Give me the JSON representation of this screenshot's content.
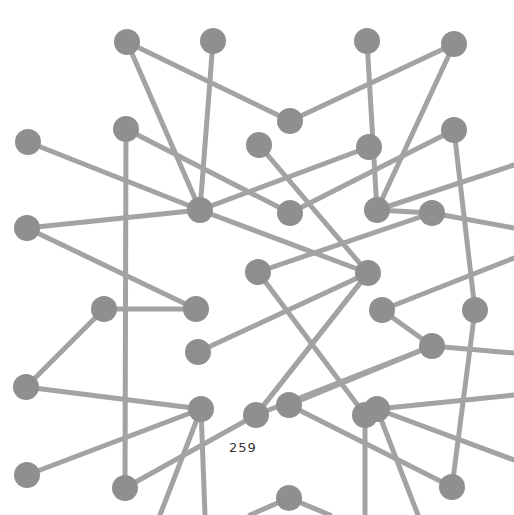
{
  "page": {
    "page_number": "259",
    "background": "#ffffff"
  },
  "diagram": {
    "type": "network-graph",
    "node_color": "#8f8f8f",
    "edge_color": "#a3a3a3",
    "node_radius": 13,
    "nodes": [
      {
        "id": "A",
        "x": 127,
        "y": 42
      },
      {
        "id": "B",
        "x": 213,
        "y": 41
      },
      {
        "id": "C",
        "x": 367,
        "y": 41
      },
      {
        "id": "D",
        "x": 454,
        "y": 44
      },
      {
        "id": "E",
        "x": 290,
        "y": 121
      },
      {
        "id": "F",
        "x": 28,
        "y": 142
      },
      {
        "id": "G",
        "x": 126,
        "y": 129
      },
      {
        "id": "H",
        "x": 259,
        "y": 145
      },
      {
        "id": "I",
        "x": 369,
        "y": 147
      },
      {
        "id": "J",
        "x": 454,
        "y": 130
      },
      {
        "id": "K",
        "x": 200,
        "y": 210
      },
      {
        "id": "L",
        "x": 290,
        "y": 213
      },
      {
        "id": "M",
        "x": 377,
        "y": 210
      },
      {
        "id": "N",
        "x": 432,
        "y": 213
      },
      {
        "id": "O",
        "x": 27,
        "y": 228
      },
      {
        "id": "P",
        "x": 258,
        "y": 272
      },
      {
        "id": "Q",
        "x": 368,
        "y": 273
      },
      {
        "id": "R",
        "x": 104,
        "y": 309
      },
      {
        "id": "S",
        "x": 196,
        "y": 309
      },
      {
        "id": "T",
        "x": 382,
        "y": 310
      },
      {
        "id": "U",
        "x": 475,
        "y": 310
      },
      {
        "id": "V",
        "x": 198,
        "y": 352
      },
      {
        "id": "W",
        "x": 432,
        "y": 346
      },
      {
        "id": "X",
        "x": 26,
        "y": 387
      },
      {
        "id": "Y",
        "x": 201,
        "y": 409
      },
      {
        "id": "Z",
        "x": 289,
        "y": 405
      },
      {
        "id": "AA",
        "x": 256,
        "y": 415
      },
      {
        "id": "AB",
        "x": 377,
        "y": 409
      },
      {
        "id": "AC",
        "x": 365,
        "y": 415
      },
      {
        "id": "AD",
        "x": 27,
        "y": 475
      },
      {
        "id": "AE",
        "x": 125,
        "y": 488
      },
      {
        "id": "AF",
        "x": 452,
        "y": 487
      },
      {
        "id": "AG",
        "x": 289,
        "y": 498
      }
    ],
    "edges": [
      [
        "A",
        "E"
      ],
      [
        "A",
        "K"
      ],
      [
        "B",
        "K"
      ],
      [
        "E",
        "D"
      ],
      [
        "C",
        "M"
      ],
      [
        "D",
        "M"
      ],
      [
        "F",
        "K"
      ],
      [
        "G",
        "L"
      ],
      [
        "G",
        "AE"
      ],
      [
        "O",
        "K"
      ],
      [
        "O",
        "S"
      ],
      [
        "K",
        "I"
      ],
      [
        "K",
        "Q"
      ],
      [
        "L",
        "J"
      ],
      [
        "H",
        "Q"
      ],
      [
        "M",
        "N"
      ],
      [
        "M",
        "514,165"
      ],
      [
        "N",
        "514,228"
      ],
      [
        "J",
        "U"
      ],
      [
        "U",
        "AF"
      ],
      [
        "P",
        "N"
      ],
      [
        "P",
        "AC"
      ],
      [
        "R",
        "S"
      ],
      [
        "R",
        "X"
      ],
      [
        "X",
        "Y"
      ],
      [
        "V",
        "Q"
      ],
      [
        "AD",
        "Y"
      ],
      [
        "Y",
        "160,515"
      ],
      [
        "Y",
        "205,515"
      ],
      [
        "Z",
        "W"
      ],
      [
        "Z",
        "AF"
      ],
      [
        "AA",
        "Q"
      ],
      [
        "AA",
        "W"
      ],
      [
        "AE",
        "AA"
      ],
      [
        "T",
        "W"
      ],
      [
        "T",
        "514,258"
      ],
      [
        "W",
        "514,353"
      ],
      [
        "AB",
        "514,395"
      ],
      [
        "AB",
        "514,460"
      ],
      [
        "AC",
        "365,515"
      ],
      [
        "AB",
        "418,515"
      ],
      [
        "AG",
        "250,515"
      ],
      [
        "AG",
        "330,515"
      ],
      [
        "Q",
        "AA"
      ]
    ]
  }
}
